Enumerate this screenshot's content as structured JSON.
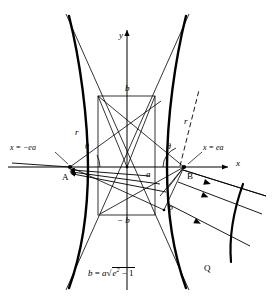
{
  "figure": {
    "type": "hyperbola-reflection-diagram",
    "caption_formula": "b = a",
    "axes": {
      "x_label": "x",
      "y_label": "y"
    },
    "labels": {
      "left_directrix": "x = −ea",
      "right_directrix": "x = ea",
      "vertex_left": "A",
      "vertex_right": "B",
      "point_p": "P",
      "point_q": "Q",
      "semi_minor_top": "b",
      "semi_minor_bottom": "− b",
      "semi_major": "a",
      "radius_left": "r",
      "radius_right": "r",
      "angle_left": "θ",
      "angle_right": "θ"
    },
    "formula": {
      "lhs": "b",
      "eq": "=",
      "coef": "a",
      "sqrt": "√",
      "radicand_base": "e",
      "radicand_exp": "2",
      "radicand_tail": "− 1"
    },
    "colors": {
      "stroke": "#000000",
      "background": "#ffffff"
    }
  }
}
